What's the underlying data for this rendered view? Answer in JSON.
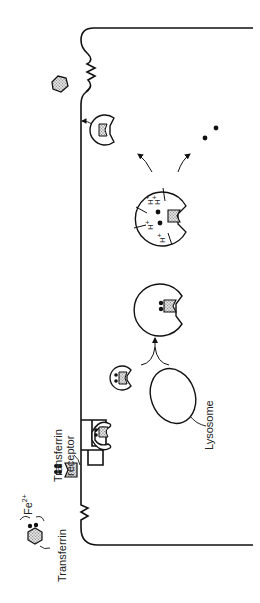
{
  "diagram": {
    "orientation": "rotated 90 degrees counter-clockwise",
    "labels": {
      "transferrin": "Transferrin",
      "iron": "Fe",
      "iron_charge": "2+",
      "receptor_line1": "Transferrin",
      "receptor_line2": "receptor",
      "lysosome": "Lysosome",
      "proton": "H",
      "proton_charge": "+"
    },
    "stages": [
      "Iron-loaded transferrin in extracellular space",
      "Transferrin binds receptor on cell surface",
      "Receptor-transferrin complex in coated pit",
      "Endocytic vesicle containing complex",
      "Vesicle fuses with lysosome",
      "Acidification (H+) releases Fe2+",
      "Free iron released into cytoplasm",
      "Receptor with apotransferrin recycled to surface",
      "Apotransferrin released from cell"
    ],
    "colors": {
      "stroke": "#111111",
      "fill_protein": "#c8c8c8",
      "background": "#ffffff"
    }
  }
}
